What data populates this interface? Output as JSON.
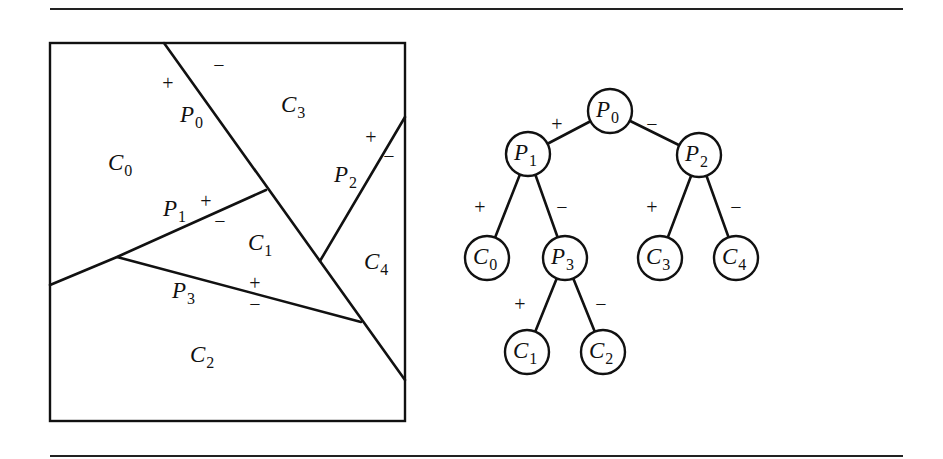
{
  "figure": {
    "partition": {
      "regions": [
        {
          "id": "C0",
          "base": "C",
          "sub": "0",
          "x": 108,
          "y": 170
        },
        {
          "id": "C1",
          "base": "C",
          "sub": "1",
          "x": 248,
          "y": 250
        },
        {
          "id": "C2",
          "base": "C",
          "sub": "2",
          "x": 190,
          "y": 362
        },
        {
          "id": "C3",
          "base": "C",
          "sub": "3",
          "x": 281,
          "y": 112
        },
        {
          "id": "C4",
          "base": "C",
          "sub": "4",
          "x": 364,
          "y": 269
        }
      ],
      "planes": [
        {
          "id": "P0",
          "base": "P",
          "sub": "0",
          "x": 180,
          "y": 122
        },
        {
          "id": "P1",
          "base": "P",
          "sub": "1",
          "x": 163,
          "y": 216
        },
        {
          "id": "P2",
          "base": "P",
          "sub": "2",
          "x": 334,
          "y": 182
        },
        {
          "id": "P3",
          "base": "P",
          "sub": "3",
          "x": 172,
          "y": 298
        }
      ],
      "signs": [
        {
          "text": "−",
          "x": 219,
          "y": 72
        },
        {
          "text": "+",
          "x": 168,
          "y": 90
        },
        {
          "text": "+",
          "x": 206,
          "y": 208
        },
        {
          "text": "−",
          "x": 220,
          "y": 228
        },
        {
          "text": "+",
          "x": 371,
          "y": 144
        },
        {
          "text": "−",
          "x": 389,
          "y": 163
        },
        {
          "text": "+",
          "x": 255,
          "y": 290
        },
        {
          "text": "−",
          "x": 255,
          "y": 311
        }
      ]
    },
    "tree": {
      "nodes": [
        {
          "id": "P0",
          "base": "P",
          "sub": "0",
          "cx": 610,
          "cy": 111
        },
        {
          "id": "P1",
          "base": "P",
          "sub": "1",
          "cx": 528,
          "cy": 154
        },
        {
          "id": "P2",
          "base": "P",
          "sub": "2",
          "cx": 699,
          "cy": 155
        },
        {
          "id": "C0",
          "base": "C",
          "sub": "0",
          "cx": 487,
          "cy": 258
        },
        {
          "id": "P3",
          "base": "P",
          "sub": "3",
          "cx": 565,
          "cy": 258
        },
        {
          "id": "C3",
          "base": "C",
          "sub": "3",
          "cx": 660,
          "cy": 258
        },
        {
          "id": "C4",
          "base": "C",
          "sub": "4",
          "cx": 736,
          "cy": 258
        },
        {
          "id": "C1",
          "base": "C",
          "sub": "1",
          "cx": 527,
          "cy": 352
        },
        {
          "id": "C2",
          "base": "C",
          "sub": "2",
          "cx": 603,
          "cy": 352
        }
      ],
      "edge_signs": [
        {
          "text": "+",
          "x": 557,
          "y": 131
        },
        {
          "text": "−",
          "x": 652,
          "y": 131
        },
        {
          "text": "+",
          "x": 480,
          "y": 214
        },
        {
          "text": "−",
          "x": 562,
          "y": 214
        },
        {
          "text": "+",
          "x": 652,
          "y": 214
        },
        {
          "text": "−",
          "x": 736,
          "y": 214
        },
        {
          "text": "+",
          "x": 520,
          "y": 311
        },
        {
          "text": "−",
          "x": 601,
          "y": 311
        }
      ]
    }
  }
}
